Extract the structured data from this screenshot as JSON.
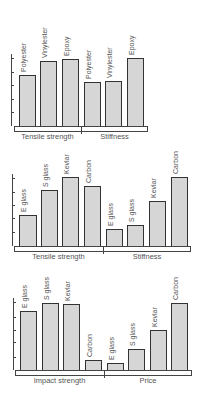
{
  "chart_data": [
    {
      "type": "bar",
      "title": "",
      "groups": [
        "Tensile strength",
        "Stiffness"
      ],
      "categories": [
        "Polyester",
        "Vinylester",
        "Epoxy"
      ],
      "series": [
        {
          "name": "Tensile strength",
          "values": [
            3.8,
            4.8,
            5.0
          ]
        },
        {
          "name": "Stiffness",
          "values": [
            3.3,
            3.3,
            5.0
          ]
        }
      ],
      "xlabel": "",
      "ylabel": "",
      "ylim": [
        0,
        5
      ],
      "yticks_unlabeled": 5,
      "grid": false,
      "legend": "none"
    },
    {
      "type": "bar",
      "title": "",
      "groups": [
        "Tensile strength",
        "Stiffness"
      ],
      "categories": [
        "E glass",
        "S glass",
        "Kevlar",
        "Carbon"
      ],
      "series": [
        {
          "name": "Tensile strength",
          "values": [
            2.3,
            4.1,
            5.1,
            4.4
          ]
        },
        {
          "name": "Stiffness",
          "values": [
            1.3,
            1.5,
            3.3,
            5.1
          ]
        }
      ],
      "xlabel": "",
      "ylabel": "",
      "ylim": [
        0,
        5
      ],
      "yticks_unlabeled": 5,
      "grid": false,
      "legend": "none"
    },
    {
      "type": "bar",
      "title": "",
      "groups": [
        "Impact strength",
        "Price"
      ],
      "categories": [
        "E glass",
        "S glass",
        "Kevlar",
        "Carbon"
      ],
      "series": [
        {
          "name": "Impact strength",
          "values": [
            4.3,
            4.9,
            4.9,
            0.7
          ]
        },
        {
          "name": "Price",
          "values": [
            0.5,
            1.5,
            2.9,
            4.9
          ]
        }
      ],
      "xlabel": "",
      "ylabel": "",
      "ylim": [
        0,
        5
      ],
      "yticks_unlabeled": 5,
      "grid": false,
      "legend": "none"
    }
  ],
  "charts": {
    "c1": {
      "bars": [
        "Polyester",
        "Vinylester",
        "Epoxy",
        "Polyester",
        "Vinylester",
        "Epoxy"
      ],
      "groups": [
        "Tensile strength",
        "Stiffness"
      ]
    },
    "c2": {
      "bars": [
        "E glass",
        "S glass",
        "Kevlar",
        "Carbon",
        "E glass",
        "S glass",
        "Kevlar",
        "Carbon"
      ],
      "groups": [
        "Tensile strength",
        "Stiffness"
      ]
    },
    "c3": {
      "bars": [
        "E glass",
        "S glass",
        "Kevlar",
        "Carbon",
        "E glass",
        "S glass",
        "Kevlar",
        "Carbon"
      ],
      "groups": [
        "Impact strength",
        "Price"
      ]
    }
  },
  "colors": {
    "bar_fill": "#d6d6d6",
    "bar_outline": "#333333",
    "axis": "#444444"
  }
}
